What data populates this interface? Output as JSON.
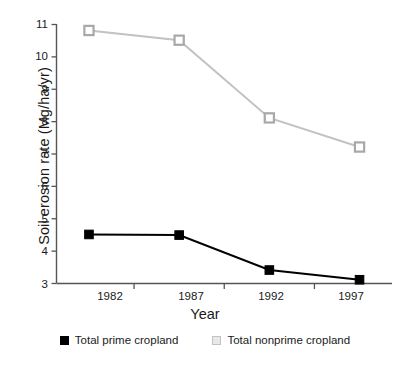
{
  "chart_data": {
    "type": "line",
    "title": "",
    "xlabel": "Year",
    "ylabel": "Soil erosion rate (Mg/ha/yr)",
    "categories": [
      "1982",
      "1987",
      "1992",
      "1997"
    ],
    "x": [
      1982,
      1987,
      1992,
      1997
    ],
    "xlim": [
      1980.2,
      1998.8
    ],
    "ylim": [
      3,
      11
    ],
    "yticks": [
      3,
      4,
      5,
      6,
      7,
      8,
      9,
      10,
      11
    ],
    "ytick_labels": [
      "3",
      "4",
      "5",
      "6",
      "7",
      "8",
      "9",
      "10",
      "11"
    ],
    "xtick_labels": [
      "1982",
      "1987",
      "1992",
      "1997"
    ],
    "grid": false,
    "legend_position": "bottom",
    "series": [
      {
        "name": "Total prime cropland",
        "color": "#000000",
        "marker": "filled-square",
        "values": [
          4.5,
          4.48,
          3.4,
          3.1
        ]
      },
      {
        "name": "Total nonprime cropland",
        "color": "#c2c2c2",
        "marker": "open-square",
        "values": [
          10.8,
          10.5,
          8.1,
          7.2
        ]
      }
    ]
  },
  "axes": {
    "y_title": "Soil erosion rate (Mg/ha/yr)",
    "x_title": "Year",
    "y_tick_labels": [
      "11",
      "10",
      "9",
      "8",
      "7",
      "6",
      "5",
      "4",
      "3"
    ],
    "x_tick_labels": [
      "1982",
      "1987",
      "1992",
      "1997"
    ]
  },
  "legend": {
    "items": [
      {
        "label": "Total prime cropland",
        "swatch": "black-square-icon"
      },
      {
        "label": "Total nonprime cropland",
        "swatch": "grey-square-icon"
      }
    ]
  },
  "colors": {
    "prime": "#000000",
    "nonprime": "#c2c2c2",
    "axis": "#555555",
    "text": "#1a1a1a"
  }
}
